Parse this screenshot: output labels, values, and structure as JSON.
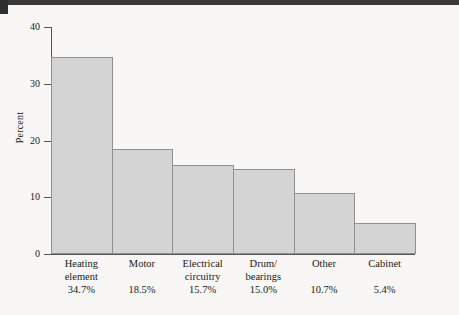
{
  "chart_data": {
    "type": "bar",
    "title": "",
    "xlabel": "",
    "ylabel": "Percent",
    "ylim": [
      0,
      40
    ],
    "yticks": [
      0,
      10,
      20,
      30,
      40
    ],
    "grid": false,
    "legend": null,
    "categories": [
      "Heating\nelement",
      "Motor",
      "Electrical\ncircuitry",
      "Drum/\nbearings",
      "Other",
      "Cabinet"
    ],
    "values": [
      34.7,
      18.5,
      15.7,
      15.0,
      10.7,
      5.4
    ],
    "data_labels": [
      "34.7%",
      "18.5%",
      "15.7%",
      "15.0%",
      "10.7%",
      "5.4%"
    ],
    "bar_fill_color": "#d4d4d4",
    "bar_edge_color": "#909090",
    "axis_color": "#555555",
    "background_color": "#f8f7f5"
  },
  "axis": {
    "y_title": "Percent",
    "y_tick_labels": [
      "40",
      "30",
      "20",
      "10",
      "0"
    ]
  }
}
